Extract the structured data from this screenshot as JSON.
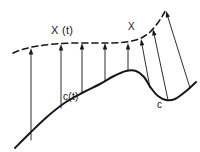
{
  "figure": {
    "labels": {
      "vector_field_at_t": "X (t)",
      "curve_at_t": "c(t)",
      "vector_field": "X",
      "curve": "c"
    },
    "colors": {
      "ink": "#171717",
      "background": "#ffffff"
    },
    "style": {
      "dashed_curve_dash_pattern": "6 4",
      "dashed_curve_width": 1.6,
      "solid_curve_width": 2.0,
      "arrow_width": 0.9
    }
  },
  "chart_data": {
    "type": "line",
    "title": "",
    "xlabel": "",
    "ylabel": "",
    "grid": false,
    "legend": "none",
    "xlim": [
      0,
      200
    ],
    "ylim": [
      152,
      0
    ],
    "series": [
      {
        "name": "c",
        "label": "c",
        "style": "solid",
        "points": [
          [
            15,
            148
          ],
          [
            30,
            133
          ],
          [
            48,
            116
          ],
          [
            66,
            102
          ],
          [
            84,
            92
          ],
          [
            100,
            84
          ],
          [
            114,
            76
          ],
          [
            126,
            71
          ],
          [
            136,
            71
          ],
          [
            144,
            77
          ],
          [
            151,
            88
          ],
          [
            158,
            96
          ],
          [
            166,
            100
          ],
          [
            175,
            99
          ],
          [
            185,
            92
          ],
          [
            196,
            82
          ]
        ]
      },
      {
        "name": "X",
        "label": "X (t)",
        "style": "dashed",
        "points": [
          [
            13,
            53
          ],
          [
            24,
            49
          ],
          [
            38,
            46
          ],
          [
            55,
            44
          ],
          [
            74,
            43
          ],
          [
            93,
            43
          ],
          [
            110,
            43
          ],
          [
            126,
            42
          ],
          [
            139,
            39
          ],
          [
            149,
            33
          ],
          [
            157,
            24
          ],
          [
            163,
            15
          ],
          [
            166,
            9
          ]
        ]
      }
    ],
    "arrows": [
      {
        "index": 1,
        "from": [
          31,
          140
        ],
        "to": [
          31,
          48
        ]
      },
      {
        "index": 2,
        "from": [
          61,
          108
        ],
        "to": [
          61,
          44
        ]
      },
      {
        "index": 3,
        "from": [
          82,
          93
        ],
        "to": [
          82,
          43
        ]
      },
      {
        "index": 4,
        "from": [
          105,
          81
        ],
        "to": [
          105,
          43
        ]
      },
      {
        "index": 5,
        "from": [
          128,
          70
        ],
        "to": [
          128,
          43
        ]
      },
      {
        "index": 6,
        "from": [
          150,
          88
        ],
        "to": [
          141,
          39
        ]
      },
      {
        "index": 7,
        "from": [
          168,
          100
        ],
        "to": [
          153,
          29
        ]
      },
      {
        "index": 8,
        "from": [
          190,
          88
        ],
        "to": [
          166,
          11
        ]
      }
    ]
  }
}
